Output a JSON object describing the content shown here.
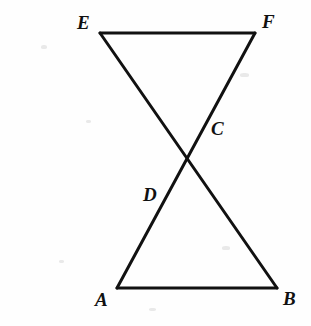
{
  "figure": {
    "background_color": "#fefefe",
    "stroke_color": "#111111",
    "stroke_width": 3,
    "label_color": "#111111",
    "label_font_size": 19
  },
  "points": {
    "A": {
      "label": "A",
      "x": 117,
      "y": 288,
      "label_x": 95,
      "label_y": 290
    },
    "B": {
      "label": "B",
      "x": 277,
      "y": 288,
      "label_x": 283,
      "label_y": 289
    },
    "C": {
      "label": "C",
      "x": 207,
      "y": 122,
      "label_x": 211,
      "label_y": 119
    },
    "D": {
      "label": "D",
      "x": 166,
      "y": 192,
      "label_x": 143,
      "label_y": 185
    },
    "E": {
      "label": "E",
      "x": 100,
      "y": 33,
      "label_x": 77,
      "label_y": 13
    },
    "F": {
      "label": "F",
      "x": 255,
      "y": 33,
      "label_x": 262,
      "label_y": 12
    }
  },
  "segments": [
    {
      "name": "segment-EF",
      "from": "E",
      "to": "F"
    },
    {
      "name": "segment-AB",
      "from": "A",
      "to": "B"
    },
    {
      "name": "segment-EB",
      "from": "E",
      "to": "B"
    },
    {
      "name": "segment-FA",
      "from": "F",
      "to": "A"
    }
  ],
  "intersections": [
    {
      "name": "intersection-D",
      "point": "D",
      "of": [
        "segment-EB",
        "segment-FA"
      ]
    },
    {
      "name": "intersection-C",
      "point": "C",
      "of": [
        "segment-EB",
        "segment-FA"
      ]
    }
  ],
  "noise_specks": [
    {
      "x": 41,
      "y": 45,
      "w": 6,
      "h": 4
    },
    {
      "x": 59,
      "y": 260,
      "w": 5,
      "h": 3
    },
    {
      "x": 240,
      "y": 73,
      "w": 9,
      "h": 4
    },
    {
      "x": 222,
      "y": 246,
      "w": 8,
      "h": 4
    },
    {
      "x": 149,
      "y": 308,
      "w": 7,
      "h": 3
    },
    {
      "x": 86,
      "y": 120,
      "w": 5,
      "h": 3
    }
  ]
}
